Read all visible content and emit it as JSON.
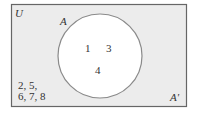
{
  "diagram": {
    "type": "venn",
    "universe_label": "U",
    "set_label": "A",
    "complement_label": "A'",
    "inside_elements": [
      "1",
      "3",
      "4"
    ],
    "outside_elements_line1": "2, 5,",
    "outside_elements_line2": "6, 7, 8",
    "colors": {
      "universe_fill": "#ececec",
      "border": "#666666",
      "circle_fill": "#ffffff",
      "circle_stroke": "#8a8a8a"
    }
  }
}
